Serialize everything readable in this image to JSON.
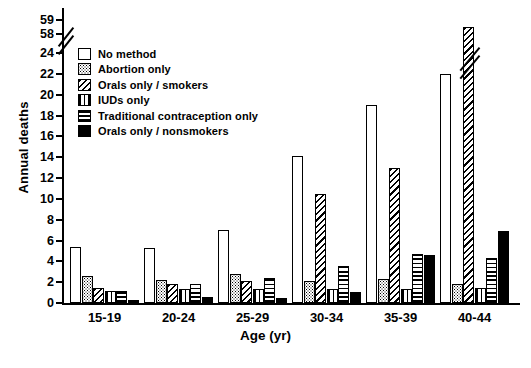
{
  "chart_data": {
    "type": "bar",
    "title": "",
    "xlabel": "Age (yr)",
    "ylabel": "Annual deaths",
    "categories": [
      "15-19",
      "20-24",
      "25-29",
      "30-34",
      "35-39",
      "40-44"
    ],
    "ylim": [
      0,
      24
    ],
    "yticks": [
      0,
      2,
      4,
      6,
      8,
      10,
      12,
      14,
      16,
      18,
      20,
      22,
      24,
      58,
      59
    ],
    "ytick_labels": [
      "0",
      "2",
      "4",
      "6",
      "8",
      "10",
      "12",
      "14",
      "16",
      "18",
      "20",
      "22",
      "24",
      "58",
      "59"
    ],
    "axis_break": {
      "present": true,
      "below": 24,
      "above": 58,
      "note": "y-axis broken between 24 and 58"
    },
    "grid": false,
    "legend_position": "upper-left-inside",
    "series": [
      {
        "name": "No method",
        "pattern": "open-white",
        "values": [
          5.4,
          5.3,
          7.0,
          14.1,
          19.0,
          22.0
        ]
      },
      {
        "name": "Abortion only",
        "pattern": "fine-dotted",
        "values": [
          2.6,
          2.2,
          2.8,
          2.1,
          2.3,
          1.8
        ]
      },
      {
        "name": "Orals only / smokers",
        "pattern": "diagonal-hatch",
        "values": [
          1.4,
          1.8,
          2.1,
          10.5,
          13.0,
          58.5
        ]
      },
      {
        "name": "IUDs only",
        "pattern": "vertical-hatch",
        "values": [
          1.2,
          1.3,
          1.3,
          1.3,
          1.3,
          1.4
        ]
      },
      {
        "name": "Traditional contraception only",
        "pattern": "horizontal-hatch",
        "values": [
          1.2,
          1.8,
          2.4,
          3.6,
          4.7,
          4.3
        ]
      },
      {
        "name": "Orals only / nonsmokers",
        "pattern": "solid-black",
        "values": [
          0.3,
          0.6,
          0.5,
          1.1,
          4.6,
          6.9
        ]
      }
    ],
    "broken_bars": [
      {
        "category": "40-44",
        "series": "Orals only / smokers",
        "value": 58.5
      }
    ]
  },
  "legend": {
    "items": [
      {
        "label": "No method",
        "icon": "swatch-open"
      },
      {
        "label": "Abortion only",
        "icon": "swatch-dotted"
      },
      {
        "label": "Orals only / smokers",
        "icon": "swatch-diagonal"
      },
      {
        "label": "IUDs only",
        "icon": "swatch-vertical"
      },
      {
        "label": "Traditional contraception only",
        "icon": "swatch-horizontal"
      },
      {
        "label": "Orals only / nonsmokers",
        "icon": "swatch-solid"
      }
    ]
  },
  "caption": ""
}
